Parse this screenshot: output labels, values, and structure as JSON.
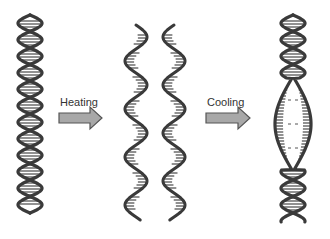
{
  "diagram": {
    "colors": {
      "strand": "#3a3a3a",
      "rung": "#555555",
      "arrow_fill": "#a8a8a8",
      "arrow_stroke": "#555555",
      "text": "#333333",
      "background": "#ffffff"
    },
    "steps": [
      {
        "id": "double-helix",
        "description": "Intact double-stranded DNA"
      },
      {
        "id": "arrow-heating",
        "label": "Heating"
      },
      {
        "id": "separated-strands",
        "description": "Two separated single strands"
      },
      {
        "id": "arrow-cooling",
        "label": "Cooling"
      },
      {
        "id": "reannealed-helix",
        "description": "Double helix with central denatured bubble"
      }
    ],
    "labels": {
      "heating": "Heating",
      "cooling": "Cooling"
    }
  }
}
